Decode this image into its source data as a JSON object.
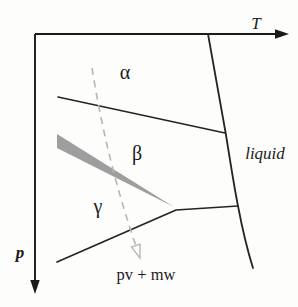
{
  "figure": {
    "type": "pressure-temperature phase diagram",
    "axes": {
      "x_label": "T",
      "y_label": "p"
    },
    "regions": {
      "alpha": "α",
      "beta": "β",
      "gamma": "γ",
      "liquid": "liquid",
      "bottom": "pv + mw"
    },
    "colors": {
      "line": "#242424",
      "two_phase_wedge": "#9e9e9e",
      "dashed_path": "#b5b8b2",
      "background": "#fdfdfb"
    }
  }
}
